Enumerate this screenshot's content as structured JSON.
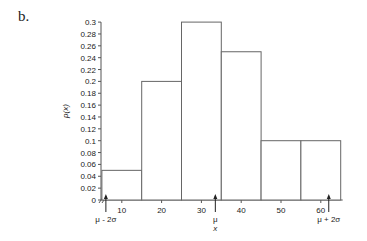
{
  "panel_label": "b.",
  "chart_data": {
    "type": "bar",
    "subtype": "histogram",
    "title": "",
    "xlabel": "x",
    "ylabel": "p(x)",
    "bins": [
      [
        5,
        15
      ],
      [
        15,
        25
      ],
      [
        25,
        35
      ],
      [
        35,
        45
      ],
      [
        45,
        55
      ],
      [
        55,
        65
      ]
    ],
    "categories": [
      "5-15",
      "15-25",
      "25-35",
      "35-45",
      "45-55",
      "55-65"
    ],
    "values": [
      0.05,
      0.2,
      0.3,
      0.25,
      0.1,
      0.1
    ],
    "ylim": [
      0,
      0.3
    ],
    "yticks": [
      "0",
      "0.02",
      "0.04",
      "0.06",
      "0.08",
      "0.1",
      "0.12",
      "0.14",
      "0.16",
      "0.18",
      "0.2",
      "0.22",
      "0.24",
      "0.26",
      "0.28",
      "0.3"
    ],
    "xticks": [
      "10",
      "20",
      "30",
      "40",
      "50",
      "60"
    ],
    "xlim": [
      3,
      65
    ],
    "axis_break": true,
    "grid": false,
    "legend": null,
    "annotations": [
      {
        "label": "μ - 2σ",
        "x": 6
      },
      {
        "label": "μ",
        "x": 33.5
      },
      {
        "label": "μ + 2σ",
        "x": 62
      }
    ]
  }
}
